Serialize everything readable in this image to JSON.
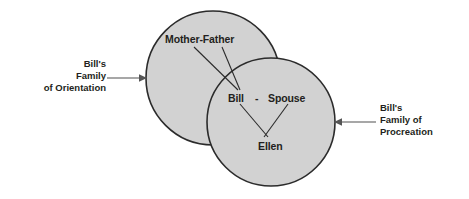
{
  "diagram": {
    "colors": {
      "circle_fill": "#d2d2d2",
      "circle_stroke": "#2b2b2b",
      "text": "#231f20",
      "pointer": "#8a8a8a",
      "background": "#ffffff"
    },
    "circles": [
      {
        "name": "family-of-orientation-circle",
        "cx": 213,
        "cy": 78,
        "r": 67
      },
      {
        "name": "family-of-procreation-circle",
        "cx": 271,
        "cy": 122,
        "r": 64
      }
    ],
    "nodes": {
      "mother_father": "Mother-Father",
      "bill": "Bill",
      "dash": "-",
      "spouse": "Spouse",
      "ellen": "Ellen"
    },
    "side_labels": {
      "left": {
        "line1": "Bill's",
        "line2": "Family",
        "line3": "of Orientation"
      },
      "right": {
        "line1": "Bill's",
        "line2": "Family of",
        "line3": "Procreation"
      }
    }
  }
}
